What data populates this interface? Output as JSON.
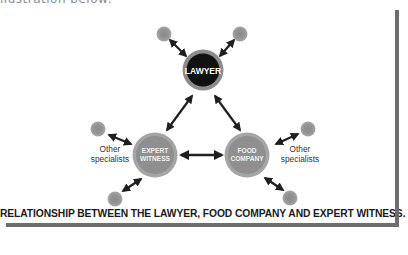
{
  "top_caption": "llustration below:",
  "diagram": {
    "nodes": {
      "lawyer": {
        "label": "LAWYER",
        "fill": "#111111",
        "ring": "#8c8c8c"
      },
      "expert_witness": {
        "line1": "EXPERT",
        "line2": "WITNESS",
        "fill": "#8f8f8f",
        "ring": "#a5a5a5"
      },
      "food_company": {
        "line1": "FOOD",
        "line2": "COMPANY",
        "fill": "#8f8f8f",
        "ring": "#a5a5a5"
      }
    },
    "left_label": {
      "line1": "Other",
      "line2": "specialists"
    },
    "right_label": {
      "line1": "Other",
      "line2": "specialists"
    },
    "caption": "RELATIONSHIP BETWEEN THE LAWYER, FOOD COMPANY AND EXPERT WITNESS.",
    "colors": {
      "arrow": "#1f1f1f",
      "small_node": "#999999",
      "small_node_core": "#888888",
      "frame": "#6e6e6e"
    }
  }
}
